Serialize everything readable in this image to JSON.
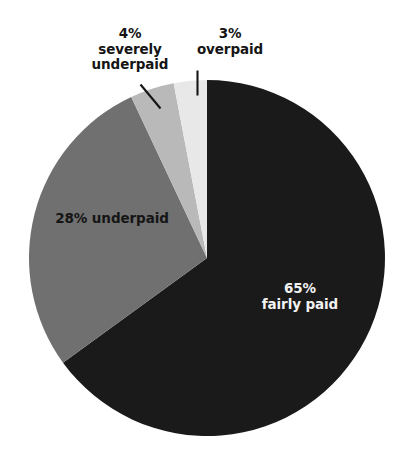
{
  "background_color": "#ffffff",
  "chart_data": {
    "type": "pie",
    "title": "",
    "subtitle": "",
    "xlabel": "",
    "ylabel": "",
    "legend_position": "none",
    "grid": false,
    "units": "percent",
    "total": 100,
    "start_angle_deg": 0,
    "direction": "clockwise",
    "categories": [
      "fairly paid",
      "underpaid",
      "severely underpaid",
      "overpaid"
    ],
    "values": [
      65,
      28,
      4,
      3
    ],
    "colors": [
      "#1a1a1a",
      "#707070",
      "#b9b9b9",
      "#e8e8e8"
    ],
    "slices": [
      {
        "key": "fairly-paid",
        "category": "fairly paid",
        "value": 65,
        "percent_text": "65%",
        "category_text": "fairly paid",
        "color": "#1a1a1a",
        "label_placement": "inside",
        "label_color": "#f2f2f2",
        "start_angle_deg": 0,
        "end_angle_deg": 234,
        "leader_line": false
      },
      {
        "key": "underpaid",
        "category": "underpaid",
        "value": 28,
        "percent_text": "28%",
        "category_text": "underpaid",
        "combined_text": "28% underpaid",
        "color": "#707070",
        "label_placement": "inside",
        "label_color": "#151515",
        "start_angle_deg": 234,
        "end_angle_deg": 334.8,
        "leader_line": false
      },
      {
        "key": "severely-underpaid",
        "category": "severely underpaid",
        "value": 4,
        "percent_text": "4%",
        "category_text": "severely underpaid",
        "category_line_1": "severely",
        "category_line_2": "underpaid",
        "color": "#b9b9b9",
        "label_placement": "outside",
        "label_color": "#151515",
        "start_angle_deg": 334.8,
        "end_angle_deg": 349.2,
        "leader_line": true,
        "leader_style": "diagonal"
      },
      {
        "key": "overpaid",
        "category": "overpaid",
        "value": 3,
        "percent_text": "3%",
        "category_text": "overpaid",
        "color": "#e8e8e8",
        "label_placement": "outside",
        "label_color": "#151515",
        "start_angle_deg": 349.2,
        "end_angle_deg": 360,
        "leader_line": true,
        "leader_style": "vertical"
      }
    ]
  }
}
